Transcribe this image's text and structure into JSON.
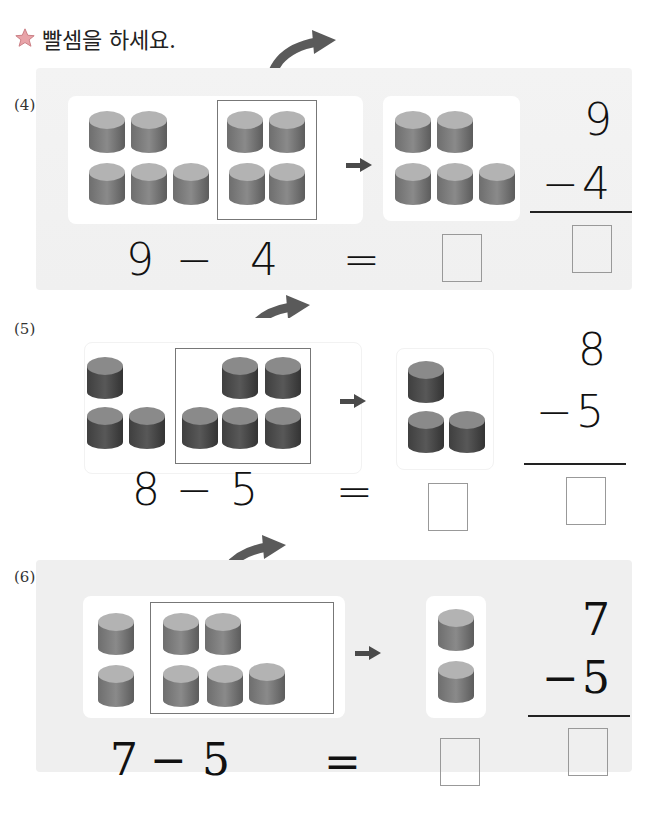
{
  "instruction": "빨셈을 하세요.",
  "problems": [
    {
      "label": "(4)",
      "minuend": "9",
      "subtrahend": "4",
      "minus": "−",
      "equals": "=",
      "vertical": {
        "top": "9",
        "bottom": "4",
        "minus": "−"
      },
      "left_cylinders_outside_box": 5,
      "cylinders_in_box": 4,
      "remaining_cylinders": 5,
      "answer_horizontal": "",
      "answer_vertical": ""
    },
    {
      "label": "(5)",
      "minuend": "8",
      "subtrahend": "5",
      "minus": "−",
      "equals": "=",
      "vertical": {
        "top": "8",
        "bottom": "5",
        "minus": "−"
      },
      "left_cylinders_outside_box": 3,
      "cylinders_in_box": 5,
      "remaining_cylinders": 3,
      "answer_horizontal": "",
      "answer_vertical": ""
    },
    {
      "label": "(6)",
      "minuend": "7",
      "subtrahend": "5",
      "minus": "−",
      "equals": "=",
      "vertical": {
        "top": "7",
        "bottom": "5",
        "minus": "−"
      },
      "left_cylinders_outside_box": 2,
      "cylinders_in_box": 5,
      "remaining_cylinders": 2,
      "answer_horizontal": "",
      "answer_vertical": ""
    }
  ],
  "colors": {
    "cylinder_light": "#a9a9a9",
    "cylinder_dark": "#555555",
    "arrow": "#5a5a5a",
    "panel4_bg": "#f2f2f2",
    "panel6_bg": "#efefef"
  }
}
